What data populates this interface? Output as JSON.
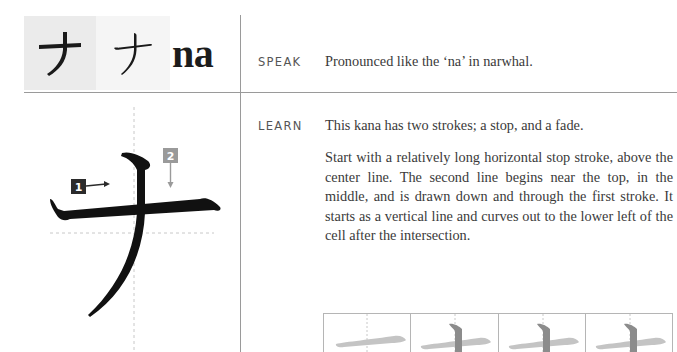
{
  "header": {
    "kana_print": "ナ",
    "kana_handwritten": "ナ",
    "romaji": "na"
  },
  "speak": {
    "label": "SPEAK",
    "text": "Pronounced like the ‘na’ in narwhal."
  },
  "learn": {
    "label": "LEARN",
    "summary": "This kana has two strokes; a stop, and a fade.",
    "description": "Start with a relatively long horizontal stop stroke, above the center line. The second line begins near the top, in the middle, and is drawn down and through the first stroke. It starts as a vertical line and curves out to the lower left of the cell after the intersection."
  },
  "stroke_diagram": {
    "character": "ナ",
    "markers": [
      {
        "number": "1",
        "direction": "right",
        "color": "#2b2b2b"
      },
      {
        "number": "2",
        "direction": "down",
        "color": "#9a9a9a"
      }
    ]
  },
  "practice_cells": [
    {
      "step": 1,
      "strokes": "stroke-1"
    },
    {
      "step": 2,
      "strokes": "stroke-1-2"
    },
    {
      "step": 3,
      "strokes": "stroke-1-2"
    },
    {
      "step": 4,
      "strokes": "stroke-1-2"
    }
  ],
  "colors": {
    "rule": "#9a9a9a",
    "ink": "#1a1a1a",
    "guide_stroke_light": "#c4c4c4",
    "guide_stroke_dark": "#8c8c8c"
  }
}
